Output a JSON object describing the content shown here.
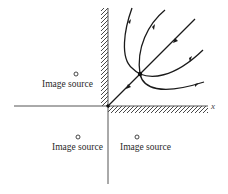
{
  "figure": {
    "axis_label_x": "x",
    "image_sources": [
      {
        "label": "Image source",
        "quadrant": "upper-left"
      },
      {
        "label": "Image source",
        "quadrant": "lower-left"
      },
      {
        "label": "Image source",
        "quadrant": "lower-right"
      }
    ],
    "walls": [
      "y-axis (positive half, hatched on left)",
      "x-axis (positive half, hatched below)"
    ],
    "colors": {
      "lines": "#1a1a1a",
      "axes": "#555555",
      "text": "#2a2a2a"
    }
  }
}
